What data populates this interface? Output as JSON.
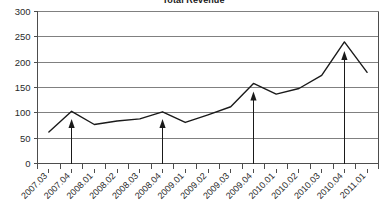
{
  "chart_data": {
    "type": "line",
    "title": "Total Revenue",
    "xlabel": "",
    "ylabel": "",
    "ylim": [
      0,
      300
    ],
    "yticks": [
      0,
      50,
      100,
      150,
      200,
      250,
      300
    ],
    "grid": true,
    "legend": "none",
    "categories": [
      "2007.03",
      "2007.04",
      "2008.01",
      "2008.02",
      "2008.03",
      "2008.04",
      "2009.01",
      "2009.02",
      "2009.03",
      "2009.04",
      "2010.01",
      "2010.02",
      "2010.03",
      "2010.04",
      "2011.01"
    ],
    "series": [
      {
        "name": "Total Revenue",
        "values": [
          62,
          103,
          77,
          84,
          88,
          102,
          81,
          96,
          112,
          158,
          137,
          148,
          174,
          240,
          180
        ]
      }
    ],
    "annotations": [
      {
        "type": "arrow",
        "category": "2007.04",
        "from_value": 0,
        "to_value": 88
      },
      {
        "type": "arrow",
        "category": "2008.04",
        "from_value": 0,
        "to_value": 88
      },
      {
        "type": "arrow",
        "category": "2009.04",
        "from_value": 0,
        "to_value": 142
      },
      {
        "type": "arrow",
        "category": "2010.04",
        "from_value": 0,
        "to_value": 222
      }
    ],
    "colors": {
      "line": "#1a1a1a",
      "grid": "#808080",
      "axis": "#4d4d4d",
      "arrow": "#1a1a1a",
      "background": "#ffffff"
    }
  }
}
